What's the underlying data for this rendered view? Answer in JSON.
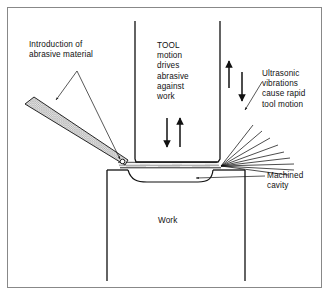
{
  "diagram": {
    "background_color": "#ffffff",
    "line_color": "#111111",
    "border_color": "#888888",
    "abrasive_fill_color": "#d9d9d9"
  },
  "labels": {
    "abrasive_intro": "Introduction of\nabrasive material",
    "tool": "TOOL\nmotion\ndrives\nabrasive\nagainst\nwork",
    "ultrasonic": "Ultrasonic\nvibrations\ncause rapid\ntool motion",
    "machined_cavity": "Machined\ncavity",
    "work": "Work"
  },
  "parts": {
    "tool_shaft": "tool-shaft",
    "work_block": "work-block",
    "machined_cavity": "machined-cavity",
    "abrasive_feed": "abrasive-feed-band",
    "vibration_rays": "vibration-ray-fan",
    "slurry_gap": "abrasive-slurry-gap"
  },
  "arrows": {
    "tool_down": "down-arrow",
    "tool_up": "up-arrow",
    "side_up": "up-arrow",
    "side_down": "down-arrow"
  },
  "leaders": {
    "abrasive_to_band": "leader-line",
    "abrasive_to_tip": "leader-line",
    "ultrasonic_to_rays": "leader-line",
    "cavity_to_surface": "leader-line"
  }
}
